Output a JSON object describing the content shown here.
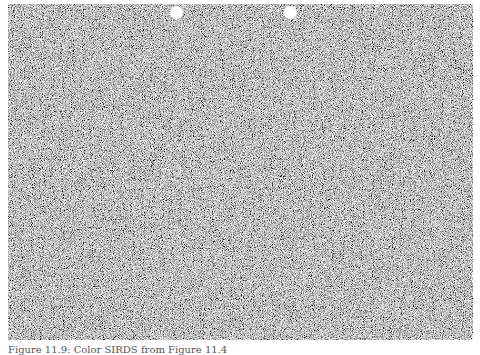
{
  "figure": {
    "type": "random-dot stereogram",
    "colors": {
      "background": "#8a8a8a",
      "page": "#ffffff",
      "alignment_dot": "#ffffff"
    },
    "alignment_dots": [
      {
        "label": "left-dot",
        "cx": 177,
        "cy": 12
      },
      {
        "label": "right-dot",
        "cx": 291,
        "cy": 12
      }
    ]
  },
  "caption": {
    "text": "Figure 11.9: Color SIRDS from Figure 11.4"
  }
}
